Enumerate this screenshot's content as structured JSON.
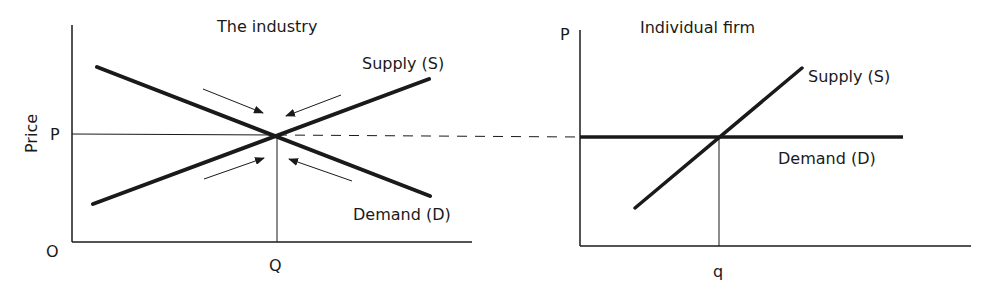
{
  "left_panel": {
    "title": "The industry",
    "y_axis_label": "Price",
    "price_label": "P",
    "origin_label": "O",
    "quantity_label": "Q",
    "supply_label": "Supply (S)",
    "demand_label": "Demand (D)"
  },
  "right_panel": {
    "title": "Individual firm",
    "price_label": "P",
    "quantity_label": "q",
    "supply_label": "Supply (S)",
    "demand_label": "Demand (D)"
  },
  "colors": {
    "ink": "#1a1a1a",
    "background": "#ffffff"
  }
}
